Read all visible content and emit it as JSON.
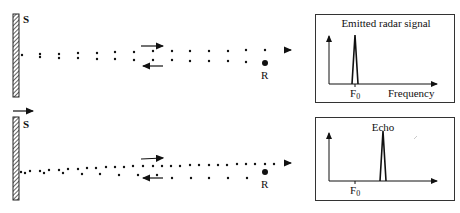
{
  "panels": [
    {
      "id": "emitted",
      "source_label": "S",
      "receiver_label": "R",
      "graph": {
        "title": "Emitted radar signal",
        "x_label": "Frequency",
        "tick_label": "F",
        "tick_subscript": "0",
        "peak_position": "at F0"
      }
    },
    {
      "id": "echo",
      "source_label": "S",
      "receiver_label": "R",
      "graph": {
        "title": "Echo",
        "x_label": "",
        "tick_label": "F",
        "tick_subscript": "0",
        "peak_position": "above F0 (shifted higher)"
      }
    }
  ],
  "colors": {
    "ink": "#111111",
    "background": "#ffffff",
    "box_border": "#333333"
  }
}
